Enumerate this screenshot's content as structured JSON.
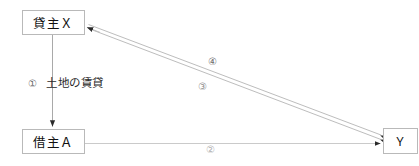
{
  "diagram": {
    "canvas": {
      "width": 419,
      "height": 166,
      "background": "#ffffff"
    },
    "nodes": [
      {
        "id": "lessor",
        "label": "貸主Ｘ",
        "x": 22,
        "y": 10,
        "w": 63,
        "h": 25
      },
      {
        "id": "lessee",
        "label": "借主Ａ",
        "x": 22,
        "y": 129,
        "w": 63,
        "h": 25
      },
      {
        "id": "y",
        "label": "Ｙ",
        "x": 383,
        "y": 128,
        "w": 35,
        "h": 26
      }
    ],
    "edges": [
      {
        "id": "edge-1",
        "marker": "①",
        "label": "土地の賃貸",
        "from": "lessor",
        "to": "lessee",
        "direction": "down",
        "color": "#a9a9a9"
      },
      {
        "id": "edge-2",
        "marker": "②",
        "label": "",
        "from": "lessee",
        "to": "y",
        "direction": "right",
        "color": "#c9c9c9"
      },
      {
        "id": "edge-3",
        "marker": "③",
        "label": "",
        "from": "y",
        "to": "lessor",
        "direction": "diagonal-up-left",
        "color": "#bcbcbc"
      },
      {
        "id": "edge-4",
        "marker": "④",
        "label": "",
        "from": "y",
        "to": "lessor",
        "direction": "diagonal-up-left",
        "color": "#bcbcbc"
      }
    ],
    "colors": {
      "box_border": "#b9b9b9",
      "box_fill": "#ffffff",
      "line_dark": "#a9a9a9",
      "line_light": "#c9c9c9",
      "arrow_head": "#2a2a2a",
      "text": "#111111"
    }
  }
}
